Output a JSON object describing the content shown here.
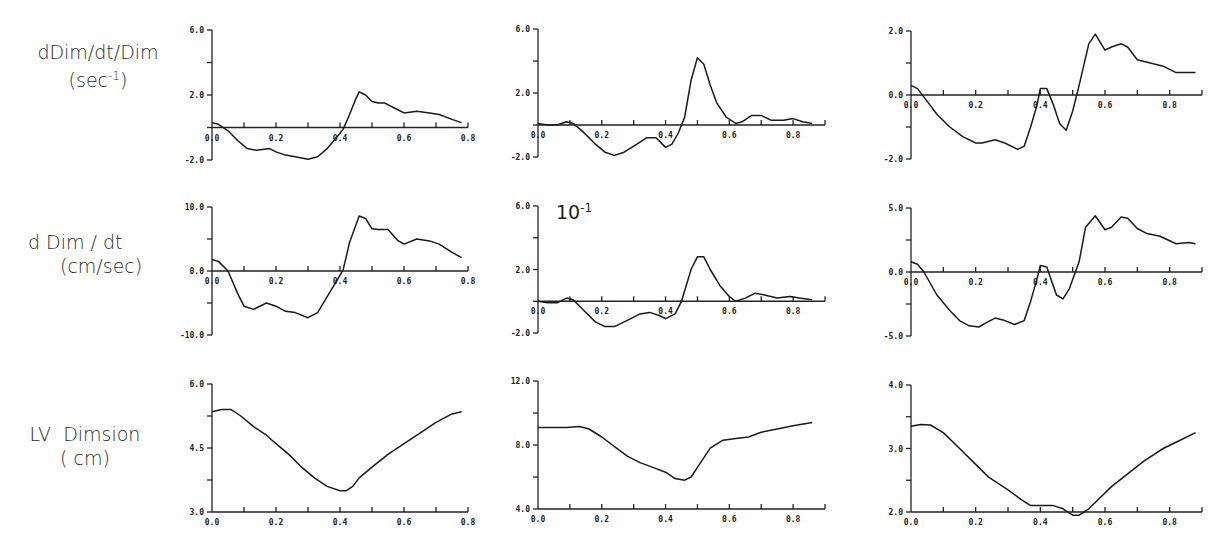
{
  "row_labels": [
    {
      "line1": "dDim/dt/Dim",
      "line2_pre": "(sec",
      "line2_sup": "-1",
      "line2_post": ")"
    },
    {
      "line1": "d Dim / dt",
      "line2_pre": "(cm/sec)",
      "line2_sup": "",
      "line2_post": ""
    },
    {
      "line1": "LV  Dimsion",
      "line2_pre": "( cm)",
      "line2_sup": "",
      "line2_post": ""
    }
  ],
  "scale_note": {
    "base": "10",
    "exp": "-1"
  },
  "chart_data": [
    {
      "type": "line",
      "row": 0,
      "col": 0,
      "title": "",
      "xlabel": "",
      "ylabel": "dDim/dt/Dim (sec-1)",
      "xlim": [
        0.0,
        0.8
      ],
      "ylim": [
        -2.0,
        6.0
      ],
      "xticks": [
        "0.0",
        "0.2",
        "0.4",
        "0.6",
        "0.8"
      ],
      "yticks": [
        "-2.0",
        "2.0",
        "6.0"
      ],
      "grid": false,
      "frame": {
        "x0": 212,
        "x1": 468,
        "y_min": 160,
        "y_max": 30
      },
      "x": [
        0,
        0.02,
        0.05,
        0.08,
        0.11,
        0.14,
        0.18,
        0.2,
        0.23,
        0.26,
        0.3,
        0.33,
        0.36,
        0.39,
        0.41,
        0.43,
        0.45,
        0.46,
        0.48,
        0.5,
        0.52,
        0.54,
        0.57,
        0.6,
        0.64,
        0.68,
        0.71,
        0.75,
        0.78
      ],
      "y": [
        0.3,
        0.2,
        -0.2,
        -0.8,
        -1.3,
        -1.4,
        -1.3,
        -1.5,
        -1.7,
        -1.8,
        -1.95,
        -1.8,
        -1.3,
        -0.6,
        -0.1,
        0.8,
        1.8,
        2.2,
        2.0,
        1.6,
        1.5,
        1.5,
        1.2,
        0.9,
        1.0,
        0.9,
        0.8,
        0.5,
        0.3
      ]
    },
    {
      "type": "line",
      "row": 0,
      "col": 1,
      "title": "",
      "xlabel": "",
      "ylabel": "",
      "xlim": [
        0.0,
        0.9
      ],
      "ylim": [
        -2.0,
        6.0
      ],
      "xticks": [
        "0.0",
        "0.2",
        "0.4",
        "0.6",
        "0.8"
      ],
      "yticks": [
        "-2.0",
        "2.0",
        "6.0"
      ],
      "grid": false,
      "frame": {
        "x0": 538,
        "x1": 825,
        "y_min": 157,
        "y_max": 29
      },
      "x": [
        0,
        0.03,
        0.06,
        0.09,
        0.11,
        0.14,
        0.18,
        0.21,
        0.24,
        0.27,
        0.31,
        0.34,
        0.37,
        0.4,
        0.42,
        0.44,
        0.46,
        0.48,
        0.5,
        0.52,
        0.54,
        0.56,
        0.59,
        0.62,
        0.64,
        0.67,
        0.7,
        0.73,
        0.77,
        0.8,
        0.83,
        0.86
      ],
      "y": [
        0.1,
        0,
        0,
        0.2,
        0.1,
        -0.4,
        -1.2,
        -1.7,
        -1.9,
        -1.7,
        -1.2,
        -0.8,
        -0.8,
        -1.4,
        -1.2,
        -0.5,
        0.5,
        2.8,
        4.2,
        3.8,
        2.5,
        1.4,
        0.5,
        0.1,
        0.2,
        0.6,
        0.6,
        0.3,
        0.3,
        0.4,
        0.2,
        0.1
      ]
    },
    {
      "type": "line",
      "row": 0,
      "col": 2,
      "title": "",
      "xlabel": "",
      "ylabel": "",
      "xlim": [
        0.0,
        0.9
      ],
      "ylim": [
        -2.0,
        2.0
      ],
      "xticks": [
        "0.0",
        "0.2",
        "0.4",
        "0.6",
        "0.8"
      ],
      "yticks": [
        "-2.0",
        "0.0",
        "2.0"
      ],
      "grid": false,
      "frame": {
        "x0": 911,
        "x1": 1202,
        "y_min": 159,
        "y_max": 31
      },
      "x": [
        0,
        0.02,
        0.05,
        0.08,
        0.12,
        0.16,
        0.2,
        0.22,
        0.26,
        0.29,
        0.33,
        0.35,
        0.37,
        0.39,
        0.4,
        0.42,
        0.44,
        0.46,
        0.48,
        0.5,
        0.52,
        0.55,
        0.57,
        0.6,
        0.62,
        0.65,
        0.67,
        0.7,
        0.74,
        0.78,
        0.82,
        0.85,
        0.88
      ],
      "y": [
        0.3,
        0.2,
        -0.2,
        -0.6,
        -1.0,
        -1.3,
        -1.5,
        -1.5,
        -1.4,
        -1.5,
        -1.7,
        -1.6,
        -1.0,
        -0.3,
        0.2,
        0.2,
        -0.3,
        -0.9,
        -1.1,
        -0.5,
        0.3,
        1.6,
        1.9,
        1.4,
        1.5,
        1.6,
        1.5,
        1.1,
        1.0,
        0.9,
        0.7,
        0.7,
        0.7
      ]
    },
    {
      "type": "line",
      "row": 1,
      "col": 0,
      "title": "",
      "xlabel": "",
      "ylabel": "d Dim / dt (cm/sec)",
      "xlim": [
        0.0,
        0.8
      ],
      "ylim": [
        -10.0,
        10.0
      ],
      "xticks": [
        "0.0",
        "0.2",
        "0.4",
        "0.6",
        "0.8"
      ],
      "yticks": [
        "-10.0",
        "0.0",
        "10.0"
      ],
      "grid": false,
      "frame": {
        "x0": 212,
        "x1": 468,
        "y_min": 335,
        "y_max": 207
      },
      "x": [
        0,
        0.02,
        0.05,
        0.08,
        0.1,
        0.13,
        0.17,
        0.2,
        0.23,
        0.26,
        0.3,
        0.33,
        0.36,
        0.39,
        0.41,
        0.43,
        0.46,
        0.48,
        0.5,
        0.52,
        0.55,
        0.58,
        0.6,
        0.64,
        0.68,
        0.71,
        0.75,
        0.78
      ],
      "y": [
        1.8,
        1.5,
        0,
        -3.5,
        -5.5,
        -6.0,
        -5.0,
        -5.5,
        -6.3,
        -6.5,
        -7.3,
        -6.5,
        -4.0,
        -1.5,
        0.2,
        4.5,
        8.6,
        8.2,
        6.6,
        6.5,
        6.5,
        4.8,
        4.2,
        5.0,
        4.7,
        4.2,
        2.9,
        2.1
      ]
    },
    {
      "type": "line",
      "row": 1,
      "col": 1,
      "title": "",
      "xlabel": "",
      "ylabel": "",
      "xlim": [
        0.0,
        0.9
      ],
      "ylim": [
        -2.0,
        6.0
      ],
      "xticks": [
        "0.0",
        "0.2",
        "0.4",
        "0.6",
        "0.8"
      ],
      "yticks": [
        "-2.0",
        "2.0",
        "6.0"
      ],
      "y_scale_factor": "10^-1",
      "grid": false,
      "frame": {
        "x0": 538,
        "x1": 825,
        "y_min": 333,
        "y_max": 206
      },
      "x": [
        0,
        0.03,
        0.06,
        0.09,
        0.11,
        0.14,
        0.18,
        0.21,
        0.24,
        0.28,
        0.32,
        0.35,
        0.38,
        0.4,
        0.43,
        0.45,
        0.48,
        0.5,
        0.52,
        0.54,
        0.57,
        0.6,
        0.62,
        0.65,
        0.68,
        0.71,
        0.75,
        0.79,
        0.82,
        0.86
      ],
      "y": [
        0.0,
        -0.1,
        -0.1,
        0.2,
        0.1,
        -0.5,
        -1.3,
        -1.6,
        -1.6,
        -1.2,
        -0.8,
        -0.7,
        -0.9,
        -1.1,
        -0.8,
        0,
        2.0,
        2.8,
        2.8,
        2.0,
        1.0,
        0.3,
        0,
        0.2,
        0.5,
        0.4,
        0.2,
        0.3,
        0.2,
        0.1
      ]
    },
    {
      "type": "line",
      "row": 1,
      "col": 2,
      "title": "",
      "xlabel": "",
      "ylabel": "",
      "xlim": [
        0.0,
        0.9
      ],
      "ylim": [
        -5.0,
        5.0
      ],
      "xticks": [
        "0.0",
        "0.2",
        "0.4",
        "0.6",
        "0.8"
      ],
      "yticks": [
        "-5.0",
        "0.0",
        "5.0"
      ],
      "grid": false,
      "frame": {
        "x0": 911,
        "x1": 1202,
        "y_min": 336,
        "y_max": 208
      },
      "x": [
        0,
        0.02,
        0.04,
        0.08,
        0.12,
        0.15,
        0.18,
        0.21,
        0.23,
        0.26,
        0.29,
        0.32,
        0.35,
        0.37,
        0.39,
        0.4,
        0.42,
        0.45,
        0.47,
        0.49,
        0.52,
        0.54,
        0.57,
        0.6,
        0.62,
        0.65,
        0.67,
        0.7,
        0.73,
        0.77,
        0.82,
        0.86,
        0.88
      ],
      "y": [
        0.8,
        0.6,
        0,
        -1.8,
        -3.0,
        -3.8,
        -4.2,
        -4.3,
        -4.0,
        -3.6,
        -3.8,
        -4.1,
        -3.8,
        -2.3,
        -0.5,
        0.5,
        0.4,
        -1.8,
        -2.1,
        -1.3,
        0.8,
        3.5,
        4.4,
        3.3,
        3.5,
        4.3,
        4.2,
        3.4,
        3.0,
        2.8,
        2.2,
        2.3,
        2.2
      ]
    },
    {
      "type": "line",
      "row": 2,
      "col": 0,
      "title": "",
      "xlabel": "",
      "ylabel": "LV Dimsion (cm)",
      "xlim": [
        0.0,
        0.8
      ],
      "ylim": [
        3.0,
        6.0
      ],
      "xticks": [
        "0.0",
        "0.2",
        "0.4",
        "0.6",
        "0.8"
      ],
      "yticks": [
        "3.0",
        "4.5",
        "6.0"
      ],
      "grid": false,
      "frame": {
        "x0": 212,
        "x1": 468,
        "y_min": 512,
        "y_max": 384
      },
      "x": [
        0,
        0.03,
        0.06,
        0.09,
        0.13,
        0.17,
        0.2,
        0.24,
        0.28,
        0.32,
        0.36,
        0.4,
        0.42,
        0.44,
        0.46,
        0.5,
        0.55,
        0.6,
        0.65,
        0.7,
        0.75,
        0.78
      ],
      "y": [
        5.35,
        5.4,
        5.4,
        5.25,
        5.0,
        4.8,
        4.6,
        4.35,
        4.05,
        3.8,
        3.6,
        3.5,
        3.5,
        3.6,
        3.8,
        4.05,
        4.35,
        4.6,
        4.85,
        5.1,
        5.3,
        5.35
      ]
    },
    {
      "type": "line",
      "row": 2,
      "col": 1,
      "title": "",
      "xlabel": "",
      "ylabel": "",
      "xlim": [
        0.0,
        0.9
      ],
      "ylim": [
        4.0,
        12.0
      ],
      "xticks": [
        "0.0",
        "0.2",
        "0.4",
        "0.6",
        "0.8"
      ],
      "yticks": [
        "4.0",
        "8.0",
        "12.0"
      ],
      "grid": false,
      "frame": {
        "x0": 538,
        "x1": 825,
        "y_min": 509,
        "y_max": 381
      },
      "x": [
        0,
        0.05,
        0.09,
        0.13,
        0.16,
        0.2,
        0.24,
        0.28,
        0.32,
        0.36,
        0.4,
        0.43,
        0.46,
        0.48,
        0.51,
        0.54,
        0.58,
        0.62,
        0.66,
        0.7,
        0.75,
        0.8,
        0.86
      ],
      "y": [
        9.1,
        9.1,
        9.1,
        9.15,
        9.0,
        8.5,
        7.9,
        7.3,
        6.9,
        6.6,
        6.3,
        5.9,
        5.8,
        6.0,
        6.9,
        7.8,
        8.3,
        8.4,
        8.5,
        8.8,
        9.0,
        9.2,
        9.4
      ]
    },
    {
      "type": "line",
      "row": 2,
      "col": 2,
      "title": "",
      "xlabel": "",
      "ylabel": "",
      "xlim": [
        0.0,
        0.9
      ],
      "ylim": [
        2.0,
        4.0
      ],
      "xticks": [
        "0.0",
        "0.2",
        "0.4",
        "0.6",
        "0.8"
      ],
      "yticks": [
        "2.0",
        "3.0",
        "4.0"
      ],
      "grid": false,
      "frame": {
        "x0": 911,
        "x1": 1202,
        "y_min": 512,
        "y_max": 385
      },
      "x": [
        0,
        0.03,
        0.06,
        0.1,
        0.14,
        0.2,
        0.24,
        0.3,
        0.34,
        0.37,
        0.4,
        0.44,
        0.47,
        0.5,
        0.52,
        0.55,
        0.58,
        0.62,
        0.67,
        0.72,
        0.78,
        0.84,
        0.88
      ],
      "y": [
        3.35,
        3.38,
        3.37,
        3.25,
        3.05,
        2.75,
        2.55,
        2.35,
        2.2,
        2.1,
        2.1,
        2.1,
        2.05,
        1.95,
        1.95,
        2.05,
        2.2,
        2.4,
        2.6,
        2.8,
        3.0,
        3.15,
        3.25
      ]
    }
  ]
}
